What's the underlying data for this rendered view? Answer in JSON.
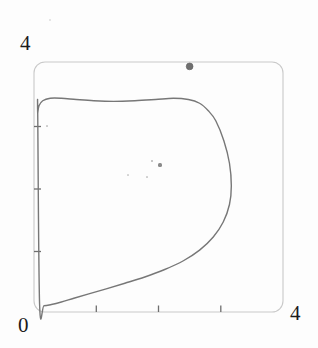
{
  "figure": {
    "kind": "scanned-plot",
    "background_color": "#fdfdfd",
    "frame": {
      "name": "plot-frame",
      "color": "#c9c9c9",
      "corner_radius_px": 11,
      "x_px": 34,
      "y_px": 62,
      "width_px": 249,
      "height_px": 250
    }
  },
  "labels": {
    "y_max": "4",
    "origin": "0",
    "x_max": "4"
  },
  "chart_data": {
    "type": "line",
    "title": "",
    "xlabel": "",
    "ylabel": "",
    "xlim": [
      0,
      4
    ],
    "ylim": [
      0,
      4
    ],
    "grid": false,
    "legend": "none",
    "xticks": [
      1,
      2,
      3
    ],
    "yticks": [
      1,
      2,
      3
    ],
    "xtick_labels": [
      "",
      "",
      ""
    ],
    "ytick_labels": [
      "",
      "",
      ""
    ],
    "axis_corner_labels": {
      "bottom_left": "0",
      "top_left": "4",
      "bottom_right": "4"
    },
    "series": [
      {
        "name": "trajectory",
        "style": "closed-loop",
        "color": "#777777",
        "linewidth": 1.4,
        "closed": true,
        "comment": "Closed orbit with a cusp-like pinch at the lower-left near the origin",
        "x": [
          0.06,
          0.08,
          0.14,
          0.26,
          0.44,
          0.68,
          0.96,
          1.28,
          1.62,
          1.95,
          2.24,
          2.48,
          2.66,
          2.8,
          2.92,
          3.05,
          3.14,
          3.17,
          3.14,
          3.04,
          2.88,
          2.66,
          2.4,
          2.1,
          1.78,
          1.46,
          1.16,
          0.88,
          0.64,
          0.44,
          0.28,
          0.16,
          0.09,
          0.06
        ],
        "y": [
          3.18,
          3.3,
          3.38,
          3.42,
          3.42,
          3.4,
          3.38,
          3.37,
          3.38,
          3.4,
          3.42,
          3.4,
          3.34,
          3.22,
          3.06,
          2.74,
          2.38,
          2.02,
          1.72,
          1.44,
          1.2,
          0.99,
          0.82,
          0.68,
          0.56,
          0.46,
          0.37,
          0.29,
          0.22,
          0.16,
          0.12,
          0.1,
          0.12,
          3.18
        ]
      }
    ],
    "points": [
      {
        "name": "marked-point",
        "x": 2.5,
        "y": 3.93,
        "color": "#6f6f6f",
        "radius_px": 3.4,
        "label": ""
      }
    ],
    "annotations": []
  },
  "artifacts": {
    "specks": [
      {
        "x_px": 160,
        "y_px": 165,
        "size_px": 3.2,
        "color": "#8a8a8a"
      },
      {
        "x_px": 152,
        "y_px": 161,
        "size_px": 1.4,
        "color": "#bdbdbd"
      },
      {
        "x_px": 147,
        "y_px": 177,
        "size_px": 1.2,
        "color": "#cfcfcf"
      },
      {
        "x_px": 128,
        "y_px": 175,
        "size_px": 1.1,
        "color": "#d4d4d4"
      },
      {
        "x_px": 47,
        "y_px": 126,
        "size_px": 1.2,
        "color": "#cccccc"
      },
      {
        "x_px": 50,
        "y_px": 20,
        "size_px": 2.0,
        "color": "#dcdcdc"
      }
    ]
  }
}
